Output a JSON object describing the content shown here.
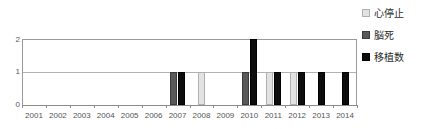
{
  "chart_data": {
    "type": "bar",
    "title": "",
    "xlabel": "",
    "ylabel": "",
    "ylim": [
      0,
      2
    ],
    "yticks": [
      0,
      1,
      2
    ],
    "ytick_labels": [
      "0",
      "1",
      "2"
    ],
    "grid": true,
    "grid_axis": "y",
    "legend_position": "right-top",
    "categories": [
      "2001",
      "2002",
      "2003",
      "2004",
      "2005",
      "2006",
      "2007",
      "2008",
      "2009",
      "2010",
      "2011",
      "2012",
      "2013",
      "2014"
    ],
    "series": [
      {
        "name": "心停止",
        "color": "#e2e2e2",
        "values": [
          0,
          0,
          0,
          0,
          0,
          0,
          0,
          1,
          0,
          0,
          1,
          1,
          0,
          0
        ]
      },
      {
        "name": "脳死",
        "color": "#595959",
        "values": [
          0,
          0,
          0,
          0,
          0,
          0,
          1,
          0,
          0,
          1,
          0,
          0,
          0,
          0
        ]
      },
      {
        "name": "移植数",
        "color": "#0d0d0d",
        "values": [
          0,
          0,
          0,
          0,
          0,
          0,
          1,
          0,
          0,
          2,
          1,
          1,
          1,
          1
        ]
      }
    ]
  },
  "legend": {
    "items": [
      {
        "label": "心停止",
        "swatch": "light-gray-swatch-icon"
      },
      {
        "label": "脳死",
        "swatch": "dark-gray-swatch-icon"
      },
      {
        "label": "移植数",
        "swatch": "black-swatch-icon"
      }
    ]
  },
  "axes": {
    "y_tick_labels": [
      "0",
      "1",
      "2"
    ],
    "x_tick_labels": [
      "2001",
      "2002",
      "2003",
      "2004",
      "2005",
      "2006",
      "2007",
      "2008",
      "2009",
      "2010",
      "2011",
      "2012",
      "2013",
      "2014"
    ]
  },
  "colors": {
    "series_0": "#e2e2e2",
    "series_1": "#595959",
    "series_2": "#0d0d0d",
    "gridline": "#b3b3b3",
    "axis": "#8c8c8c",
    "text": "#555555",
    "background": "#ffffff"
  }
}
